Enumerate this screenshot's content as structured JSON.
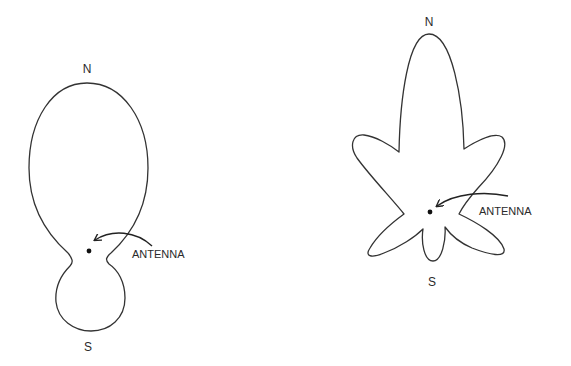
{
  "diagrams": [
    {
      "id": "left",
      "description": "Directional antenna radiation pattern: large forward (north) lobe with small back (south) lobe",
      "labels": {
        "north": "N",
        "south": "S",
        "antenna": "ANTENNA"
      }
    },
    {
      "id": "right",
      "description": "Antenna radiation pattern with narrow main north lobe and multiple side lobes",
      "labels": {
        "north": "N",
        "south": "S",
        "antenna": "ANTENNA"
      }
    }
  ],
  "colors": {
    "stroke": "#333333",
    "text": "#2a2a2a",
    "background": "#ffffff"
  }
}
